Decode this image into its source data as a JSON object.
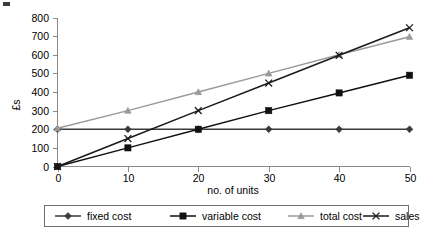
{
  "chart_data": {
    "type": "line",
    "title": "",
    "xlabel": "no. of units",
    "ylabel": "£s",
    "x": [
      0,
      10,
      20,
      30,
      40,
      50
    ],
    "xlim": [
      0,
      50
    ],
    "ylim": [
      0,
      800
    ],
    "xticks": [
      "0",
      "10",
      "20",
      "30",
      "40",
      "50"
    ],
    "yticks": [
      "0",
      "100",
      "200",
      "300",
      "400",
      "500",
      "600",
      "700",
      "800"
    ],
    "grid": false,
    "legend_position": "bottom",
    "series": [
      {
        "name": "fixed cost",
        "values": [
          200,
          200,
          200,
          200,
          200,
          200
        ],
        "color": "#3a3a3a",
        "marker": "diamond"
      },
      {
        "name": "variable cost",
        "values": [
          0,
          100,
          200,
          300,
          395,
          490
        ],
        "color": "#111111",
        "marker": "square"
      },
      {
        "name": "total cost",
        "values": [
          205,
          300,
          400,
          500,
          600,
          697
        ],
        "color": "#9a9a9a",
        "marker": "triangle"
      },
      {
        "name": "sales",
        "values": [
          0,
          150,
          300,
          448,
          597,
          745
        ],
        "color": "#1a1a1a",
        "marker": "x"
      }
    ]
  },
  "axes": {
    "y_title": "£s",
    "x_title": "no. of units"
  },
  "legend": {
    "items": [
      {
        "label": "fixed cost",
        "marker": "diamond-marker",
        "color": "#3a3a3a"
      },
      {
        "label": "variable cost",
        "marker": "square-marker",
        "color": "#111111"
      },
      {
        "label": "total cost",
        "marker": "triangle-marker",
        "color": "#9a9a9a"
      },
      {
        "label": "sales",
        "marker": "x-marker",
        "color": "#1a1a1a"
      }
    ]
  }
}
